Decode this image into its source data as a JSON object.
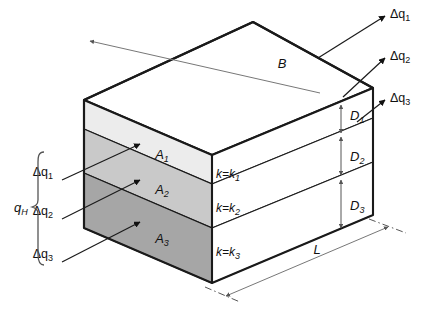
{
  "figure": {
    "type": "engineering-diagram",
    "background_color": "#ffffff",
    "outline_color": "#1a1a1a"
  },
  "dimensions": {
    "width_label": "B",
    "length_label": "L",
    "thickness_labels": [
      "D",
      "D",
      "D"
    ],
    "thickness_subscripts": [
      "1",
      "2",
      "3"
    ]
  },
  "layers": [
    {
      "area_label": "A",
      "area_subscript": "1",
      "conductivity_label": "k=k",
      "conductivity_subscript": "1",
      "thickness_label": "D",
      "thickness_subscript": "1",
      "fill_color": "#ececec"
    },
    {
      "area_label": "A",
      "area_subscript": "2",
      "conductivity_label": "k=k",
      "conductivity_subscript": "2",
      "thickness_label": "D",
      "thickness_subscript": "2",
      "fill_color": "#c9c9c9"
    },
    {
      "area_label": "A",
      "area_subscript": "3",
      "conductivity_label": "k=k",
      "conductivity_subscript": "3",
      "thickness_label": "D",
      "thickness_subscript": "3",
      "fill_color": "#a6a6a6"
    }
  ],
  "top_face": {
    "fill_color": "#ffffff"
  },
  "right_face": {
    "fill_color": "#ffffff"
  },
  "inflow": {
    "total_label": "q",
    "total_subscript": "H",
    "brace": "curly-brace-left",
    "arrows": [
      {
        "delta": "Δq",
        "subscript": "1"
      },
      {
        "delta": "Δq",
        "subscript": "2"
      },
      {
        "delta": "Δq",
        "subscript": "3"
      }
    ]
  },
  "outflow": {
    "arrows": [
      {
        "delta": "Δq",
        "subscript": "1"
      },
      {
        "delta": "Δq",
        "subscript": "2"
      },
      {
        "delta": "Δq",
        "subscript": "3"
      }
    ]
  }
}
